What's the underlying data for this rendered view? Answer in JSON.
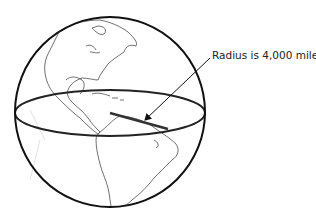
{
  "diagram": {
    "annotation": "Radius is 4,000 miles.",
    "elements": {
      "globe": {
        "cx": 110,
        "cy": 112,
        "r": 95
      },
      "equator": {
        "cx": 110,
        "cy": 113,
        "rx": 95,
        "ry": 23
      },
      "radius_line": {
        "x1": 110,
        "y1": 113,
        "x2": 168,
        "y2": 129
      },
      "arrow": {
        "x1": 210,
        "y1": 58,
        "x2": 144,
        "y2": 120
      }
    },
    "colors": {
      "outline": "#111111",
      "coast": "#333333",
      "background": "#ffffff"
    }
  }
}
